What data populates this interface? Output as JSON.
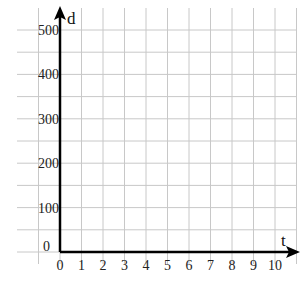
{
  "chart_data": {
    "type": "line",
    "title": "",
    "xlabel": "t",
    "ylabel": "d",
    "x_ticks": [
      "0",
      "1",
      "2",
      "3",
      "4",
      "5",
      "6",
      "7",
      "8",
      "9",
      "10"
    ],
    "y_ticks": [
      "0",
      "100",
      "200",
      "300",
      "400",
      "500"
    ],
    "xlim": [
      0,
      10
    ],
    "ylim": [
      0,
      500
    ],
    "x_minor_step": 1,
    "y_minor_step": 50,
    "grid": true,
    "series": [],
    "legend": null,
    "colors": {
      "axis": "#000000",
      "grid": "#c8c8c8",
      "text": "#222222"
    }
  }
}
